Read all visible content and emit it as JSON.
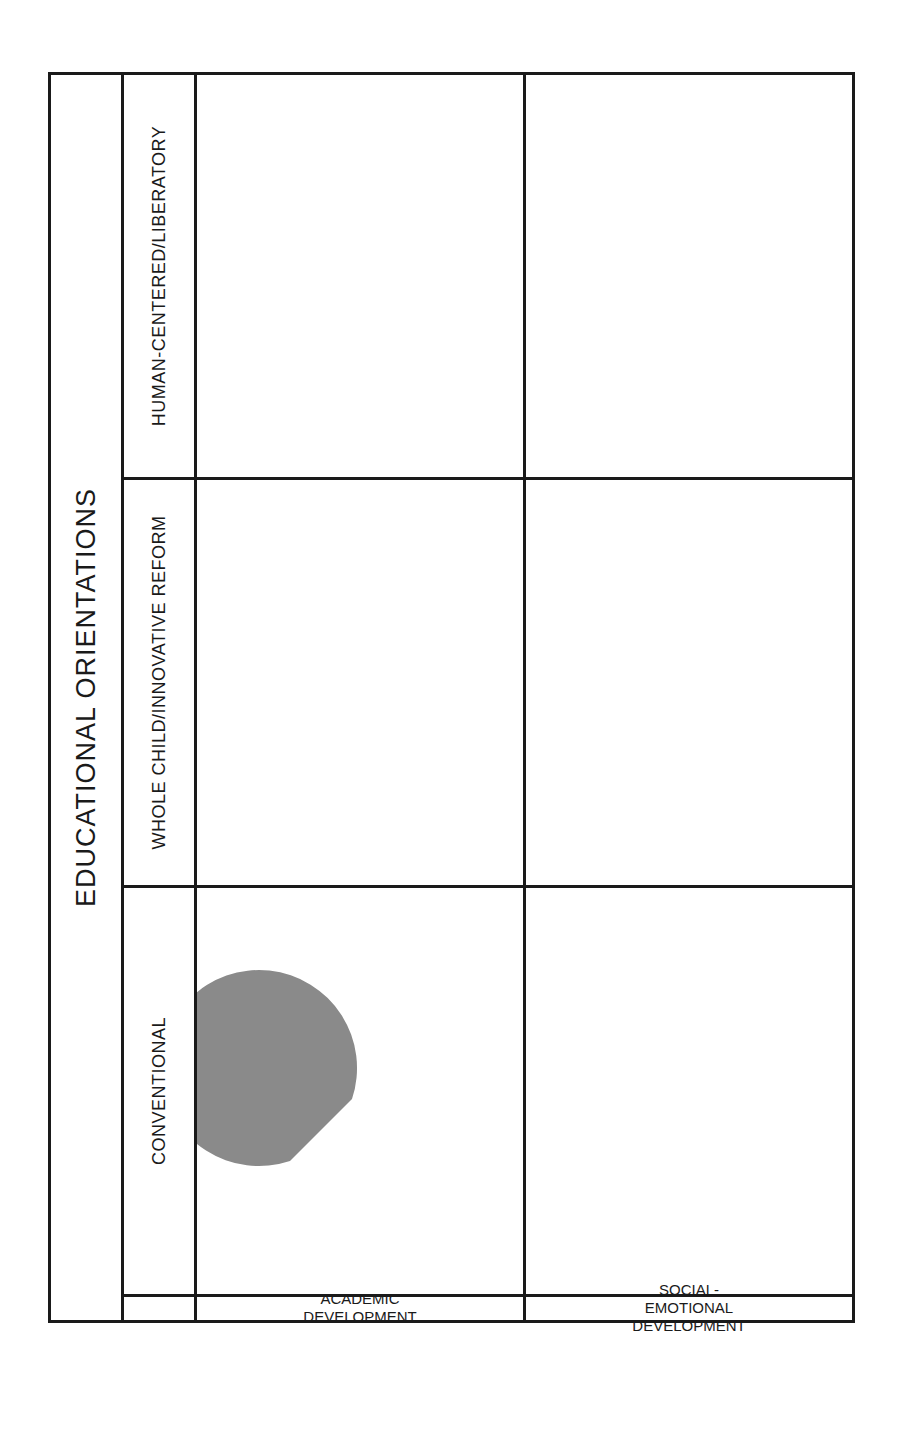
{
  "title": "EDUCATIONAL ORIENTATIONS",
  "colors": {
    "border": "#1a1a1a",
    "core_academics": "#8a8a8a",
    "non_core": "#4f4f4f",
    "cognitive_skills": "#a8a8a8",
    "college_prep_triangle": "#111111",
    "character": "#505050",
    "emotional": "#8f8f8f",
    "social": "#a0a0a0",
    "relationship_to_community": "#333333",
    "social_justice": "#3d3d3d"
  },
  "orientations": [
    {
      "label": "CONVENTIONAL"
    },
    {
      "label": "WHOLE CHILD/INNOVATIVE REFORM"
    },
    {
      "label": "HUMAN-CENTERED/LIBERATORY"
    }
  ],
  "dimensions": [
    {
      "label": "ACADEMIC DEVELOPMENT"
    },
    {
      "label": "SOCIAL-EMOTIONAL\nDEVELOPMENT"
    }
  ],
  "academic": {
    "conventional": {
      "core_academics": "CORE|ACADEMICS",
      "non_core": "NON-CORE",
      "cognitive_skills": "COGNITIVE|SKILLS",
      "triangle": "COLLEGE|PREP"
    },
    "whole_child": {
      "core_academics": "CORE|ACADEMICS",
      "non_core": "NON-CORE/|SPECIALS",
      "cognitive_skills": "COGNITIVE|SKILLS",
      "triangle": "COLLEGE/|CAREER PREP"
    },
    "human_centered": {
      "core_academics": "CORE|ACADEMICS",
      "non_core": "NON-CORE/|SPECIALS",
      "cognitive_skills": "COGNITIVE|SKILLS",
      "triangle": "INTERDISCIPLINARY|ENGAGEMENT"
    }
  },
  "social_emotional": {
    "conventional": {
      "character": "CHARACTER",
      "emotional": "EMOTIONAL",
      "social": "SOCIAL"
    },
    "whole_child": {
      "character": "CHARACTER",
      "emotional": "EMOTIONAL",
      "social": "SOCIAL",
      "relationship": "RELATIONSHIP|TO COMMUNITY"
    },
    "human_centered": {
      "character": "CHARACTER",
      "social_justice": "SOCIAL JUSTICE",
      "emotional": "EMOTIONAL",
      "social": "SOCIAL",
      "relationship": "RELATIONSHIP|TO COMMUNITY"
    }
  }
}
